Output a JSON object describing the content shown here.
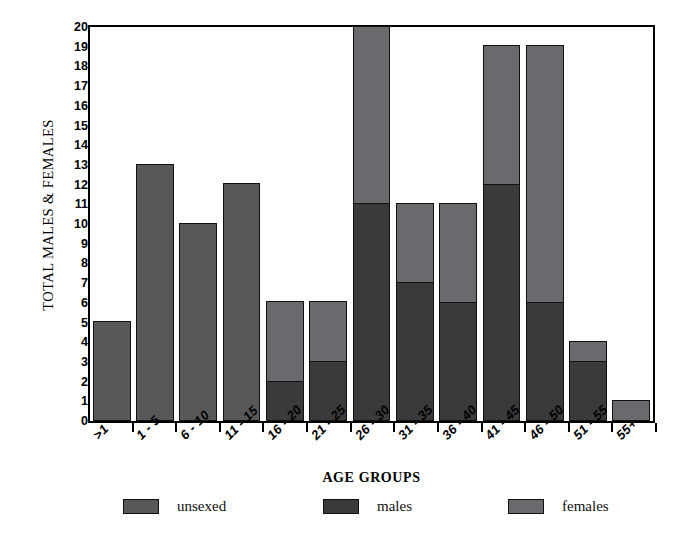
{
  "chart_data": {
    "type": "bar",
    "subtype": "stacked",
    "title": "",
    "xlabel": "AGE GROUPS",
    "ylabel": "TOTAL MALES & FEMALES",
    "ylim": [
      0,
      20
    ],
    "ytick_step": 1,
    "grid": false,
    "legend_position": "bottom",
    "categories": [
      "&gt;1",
      "1 - 5",
      "6 - 10",
      "11 - 15",
      "16 - 20",
      "21 - 25",
      "26 - 30",
      "31 - 35",
      "36 - 40",
      "41 - 45",
      "46 - 50",
      "51 - 55",
      "55+"
    ],
    "yticks": [
      "0",
      "1",
      "2",
      "3",
      "4",
      "5",
      "6",
      "7",
      "8",
      "9",
      "10",
      "11",
      "12",
      "13",
      "14",
      "15",
      "16",
      "17",
      "18",
      "19",
      "20"
    ],
    "series": [
      {
        "name": "males",
        "color": "#3a3a3c",
        "values": [
          0,
          0,
          0,
          0,
          2,
          3,
          11,
          7,
          6,
          12,
          6,
          3,
          0
        ]
      },
      {
        "name": "unsexed",
        "color": "#58585a",
        "values": [
          5,
          13,
          10,
          12,
          0,
          0,
          0,
          0,
          0,
          0,
          0,
          0,
          0
        ]
      },
      {
        "name": "females",
        "color": "#6a6a6e",
        "values": [
          0,
          0,
          0,
          0,
          4,
          3,
          9,
          4,
          5,
          7,
          13,
          1,
          1
        ]
      }
    ],
    "totals": [
      5,
      13,
      10,
      12,
      6,
      6,
      20,
      11,
      11,
      19,
      19,
      4,
      1
    ],
    "legend": [
      {
        "label": "unsexed",
        "color": "#58585a"
      },
      {
        "label": "males",
        "color": "#3a3a3c"
      },
      {
        "label": "females",
        "color": "#6a6a6e"
      }
    ]
  }
}
